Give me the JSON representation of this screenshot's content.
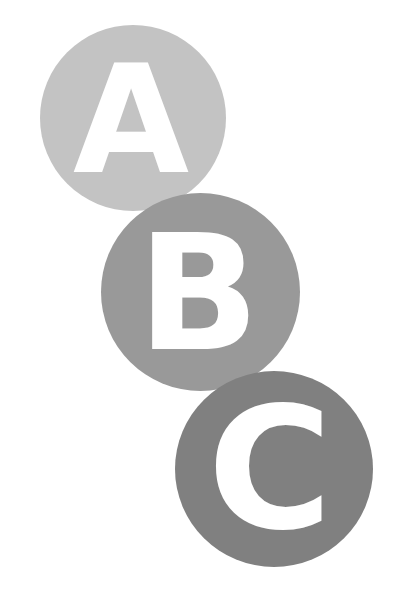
{
  "graphic": {
    "circles": [
      {
        "letter": "A",
        "color": "#c3c3c3"
      },
      {
        "letter": "B",
        "color": "#999999"
      },
      {
        "letter": "C",
        "color": "#808080"
      }
    ],
    "letter_color": "#ffffff",
    "background": "#ffffff"
  }
}
